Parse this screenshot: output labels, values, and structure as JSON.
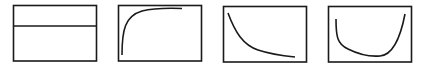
{
  "diagram": {
    "title": "",
    "background": "#ffffff",
    "stroke_color": "#1a1a1a",
    "panels": [
      {
        "id": "constant",
        "shape": "horizontal line",
        "description": "constant / flat curve"
      },
      {
        "id": "saturating",
        "shape": "rises steeply then plateaus",
        "description": "saturating growth curve"
      },
      {
        "id": "decay",
        "shape": "decreases steeply then flattens",
        "description": "exponential decay curve"
      },
      {
        "id": "bathtub",
        "shape": "U-shape, high at both ends",
        "description": "bathtub curve"
      }
    ]
  }
}
